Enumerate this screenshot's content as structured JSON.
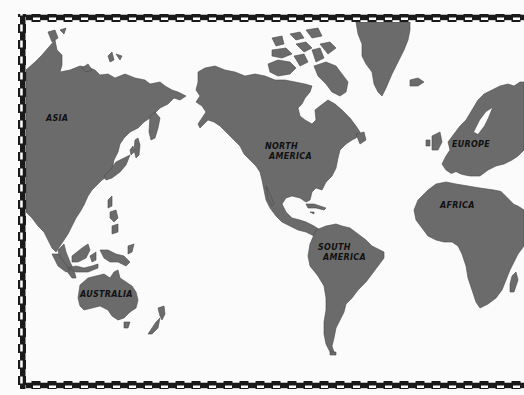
{
  "map": {
    "type": "world-outline-map",
    "colors": {
      "land": "#6b6b6b",
      "ocean": "#fbfbfb",
      "border_dark": "#1a1a1a",
      "border_light": "#ffffff"
    },
    "labels": {
      "asia": "ASIA",
      "north_america_line1": "NORTH",
      "north_america_line2": "AMERICA",
      "south_america_line1": "SOUTH",
      "south_america_line2": "AMERICA",
      "europe": "EUROPE",
      "africa": "AFRICA",
      "australia": "AUSTRALIA"
    }
  }
}
